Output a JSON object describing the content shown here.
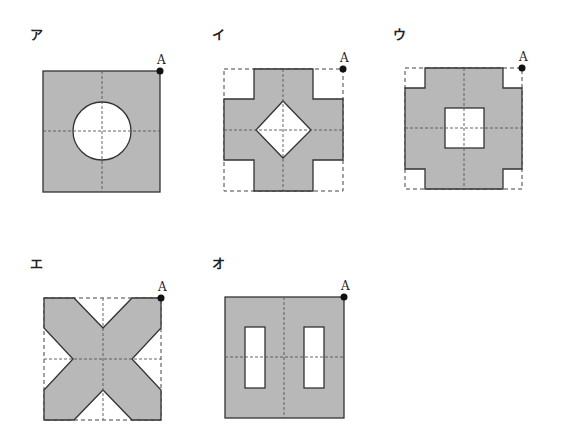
{
  "figures": [
    {
      "id": "a",
      "label": "ア",
      "shape": "square with circular hole",
      "point": "A"
    },
    {
      "id": "i",
      "label": "イ",
      "shape": "cross (plus) with diamond hole",
      "point": "A"
    },
    {
      "id": "u",
      "label": "ウ",
      "shape": "square with notched corners and square hole",
      "point": "A"
    },
    {
      "id": "e",
      "label": "エ",
      "shape": "X shape",
      "point": "A"
    },
    {
      "id": "o",
      "label": "オ",
      "shape": "square with two vertical rectangular holes",
      "point": "A"
    }
  ],
  "colors": {
    "fill": "#b8b8b8",
    "stroke": "#333333",
    "guide": "#555555",
    "point": "#111111"
  }
}
